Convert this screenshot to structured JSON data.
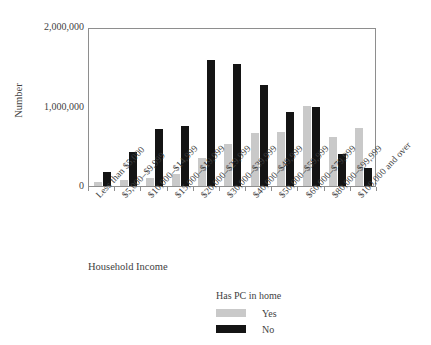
{
  "chart_data": {
    "type": "bar",
    "title": "",
    "xlabel": "Household Income",
    "ylabel": "Number",
    "ylim": [
      0,
      2000000
    ],
    "yticks": [
      0,
      1000000,
      2000000
    ],
    "ytick_labels": [
      "0",
      "1,000,000",
      "2,000,000"
    ],
    "grid": false,
    "legend_title": "Has PC in home",
    "legend_position": "bottom-center",
    "categories": [
      "Less than $5,000",
      "$5,000–$9,999",
      "$10,000–$14,999",
      "$15,000–$19,999",
      "$20,000–$29,999",
      "$30,000–$39,999",
      "$40,000–$49,999",
      "$50,000–$59,999",
      "$60,000–$79,999",
      "$80,000–$99,999",
      "$100,000 and over"
    ],
    "series": [
      {
        "name": "Yes",
        "color": "#c9c9c9",
        "values": [
          55000,
          80000,
          100000,
          155000,
          350000,
          530000,
          670000,
          680000,
          1010000,
          620000,
          730000
        ]
      },
      {
        "name": "No",
        "color": "#141414",
        "values": [
          175000,
          430000,
          720000,
          760000,
          1580000,
          1530000,
          1270000,
          930000,
          1000000,
          400000,
          225000
        ]
      }
    ]
  },
  "legend": {
    "title": "Has PC in home",
    "entries": [
      {
        "label": "Yes",
        "color": "#c9c9c9"
      },
      {
        "label": "No",
        "color": "#141414"
      }
    ]
  },
  "axes": {
    "y_title": "Number",
    "x_title": "Household Income"
  }
}
